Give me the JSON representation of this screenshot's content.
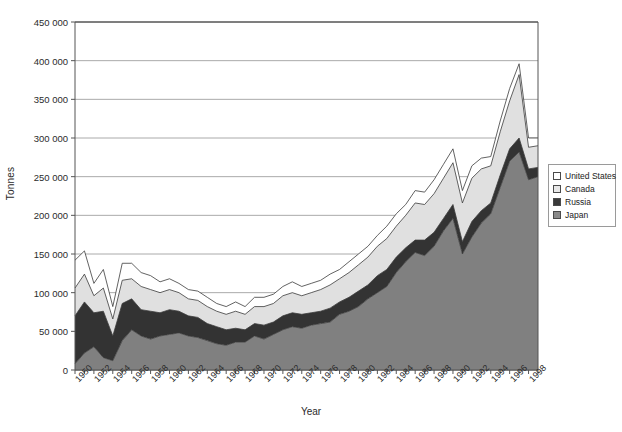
{
  "chart_data": {
    "type": "area",
    "stacked": true,
    "title": "",
    "xlabel": "Year",
    "ylabel": "Tonnes",
    "ylim": [
      0,
      450000
    ],
    "ytick_step": 50000,
    "ytick_labels": [
      "0",
      "50 000",
      "100 000",
      "150 000",
      "200 000",
      "250 000",
      "300 000",
      "350 000",
      "400 000",
      "450 000"
    ],
    "grid": "horizontal",
    "legend_position": "right",
    "x": [
      1950,
      1951,
      1952,
      1953,
      1954,
      1955,
      1956,
      1957,
      1958,
      1959,
      1960,
      1961,
      1962,
      1963,
      1964,
      1965,
      1966,
      1967,
      1968,
      1969,
      1970,
      1971,
      1972,
      1973,
      1974,
      1975,
      1976,
      1977,
      1978,
      1979,
      1980,
      1981,
      1982,
      1983,
      1984,
      1985,
      1986,
      1987,
      1988,
      1989,
      1990,
      1991,
      1992,
      1993,
      1994,
      1995,
      1996,
      1997,
      1998,
      1999
    ],
    "xtick_labels": [
      "1950",
      "1952",
      "1954",
      "1956",
      "1958",
      "1960",
      "1962",
      "1964",
      "1966",
      "1968",
      "1970",
      "1972",
      "1974",
      "1976",
      "1978",
      "1980",
      "1982",
      "1984",
      "1986",
      "1988",
      "1990",
      "1992",
      "1994",
      "1996",
      "1998"
    ],
    "series": [
      {
        "name": "Japan",
        "color": "#808080",
        "values": [
          8000,
          22000,
          30000,
          16000,
          12000,
          38000,
          52000,
          44000,
          40000,
          44000,
          46000,
          48000,
          44000,
          42000,
          38000,
          34000,
          32000,
          36000,
          36000,
          44000,
          40000,
          46000,
          52000,
          56000,
          54000,
          58000,
          60000,
          62000,
          72000,
          76000,
          82000,
          92000,
          100000,
          108000,
          126000,
          140000,
          152000,
          148000,
          160000,
          180000,
          196000,
          150000,
          172000,
          190000,
          202000,
          236000,
          270000,
          282000,
          246000,
          250000
        ]
      },
      {
        "name": "Russia",
        "color": "#333333",
        "values": [
          62000,
          66000,
          44000,
          60000,
          32000,
          48000,
          40000,
          34000,
          36000,
          30000,
          32000,
          28000,
          26000,
          26000,
          22000,
          22000,
          20000,
          18000,
          16000,
          16000,
          18000,
          16000,
          18000,
          18000,
          18000,
          16000,
          16000,
          18000,
          16000,
          18000,
          20000,
          18000,
          22000,
          22000,
          20000,
          18000,
          16000,
          20000,
          18000,
          16000,
          18000,
          16000,
          20000,
          16000,
          14000,
          16000,
          16000,
          18000,
          14000,
          12000
        ]
      },
      {
        "name": "Canada",
        "color": "#e0e0e0",
        "values": [
          36000,
          36000,
          22000,
          30000,
          22000,
          30000,
          26000,
          30000,
          28000,
          26000,
          26000,
          24000,
          22000,
          22000,
          22000,
          20000,
          20000,
          22000,
          20000,
          22000,
          24000,
          24000,
          26000,
          26000,
          24000,
          26000,
          28000,
          30000,
          30000,
          32000,
          34000,
          36000,
          38000,
          40000,
          40000,
          42000,
          48000,
          46000,
          50000,
          52000,
          54000,
          50000,
          56000,
          54000,
          48000,
          56000,
          62000,
          82000,
          28000,
          28000
        ]
      },
      {
        "name": "United States",
        "color": "#ffffff",
        "values": [
          36000,
          30000,
          16000,
          24000,
          16000,
          22000,
          20000,
          18000,
          18000,
          14000,
          14000,
          12000,
          12000,
          12000,
          12000,
          10000,
          10000,
          12000,
          10000,
          12000,
          12000,
          12000,
          12000,
          14000,
          12000,
          12000,
          12000,
          14000,
          12000,
          14000,
          14000,
          14000,
          14000,
          16000,
          16000,
          14000,
          16000,
          16000,
          18000,
          18000,
          18000,
          16000,
          16000,
          14000,
          12000,
          14000,
          16000,
          14000,
          12000,
          10000
        ]
      }
    ]
  },
  "legend": {
    "items": [
      {
        "label": "United States",
        "color": "#ffffff"
      },
      {
        "label": "Canada",
        "color": "#e8e8e8"
      },
      {
        "label": "Russia",
        "color": "#3a3a3a"
      },
      {
        "label": "Japan",
        "color": "#8a8a8a"
      }
    ]
  },
  "axes": {
    "y_title": "Tonnes",
    "x_title": "Year"
  },
  "colors": {
    "axis": "#555555",
    "grid": "#aaaaaa",
    "plot_border": "#555555",
    "text": "#2b2b2b"
  }
}
